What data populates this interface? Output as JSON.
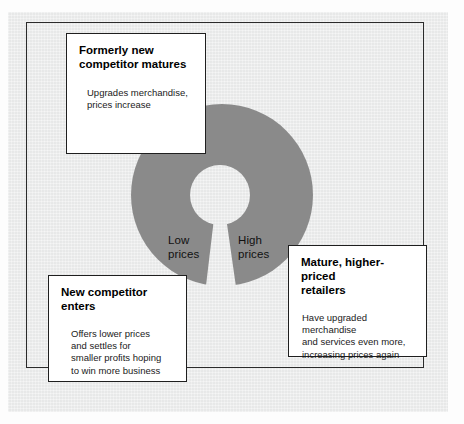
{
  "figure": {
    "type": "cycle-diagram",
    "name": "retail-accordion-cycle",
    "ring_color": "#8a8a8a",
    "paper_color": "#eceded",
    "box_border_color": "#1f1f1f"
  },
  "ring": {
    "low_price_label": "Low\nprices",
    "high_price_label": "High\nprices"
  },
  "boxes": [
    {
      "id": "formerly-new-competitor",
      "title": "Formerly new\ncompetitor matures",
      "body": "Upgrades merchandise,\nprices increase"
    },
    {
      "id": "new-competitor-enters",
      "title": "New competitor enters",
      "body": "Offers lower prices\nand settles for\nsmaller profits hoping\nto win more business"
    },
    {
      "id": "mature-higher-priced-retailers",
      "title": "Mature, higher-priced\nretailers",
      "body": "Have upgraded merchandise\nand services even more,\nincreasing prices again"
    }
  ]
}
